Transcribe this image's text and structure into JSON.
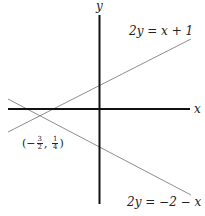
{
  "diagram": {
    "axes": {
      "x_label": "x",
      "y_label": "y",
      "color": "#111111"
    },
    "lines": [
      {
        "equation": "2y = x + 1",
        "lhs": "2y",
        "eq": " = ",
        "rhs": "x + 1",
        "color": "#777777"
      },
      {
        "equation": "2y = −2 − x",
        "lhs": "2y",
        "eq": " = ",
        "rhs": "−2 − x",
        "color": "#777777"
      }
    ],
    "intersection": {
      "label_open": "(−",
      "x_num": "3",
      "x_den": "2",
      "sep": ", ",
      "y_num": "1",
      "y_den": "4",
      "label_close": ")",
      "value": "(−3/2, 1/4)"
    }
  }
}
